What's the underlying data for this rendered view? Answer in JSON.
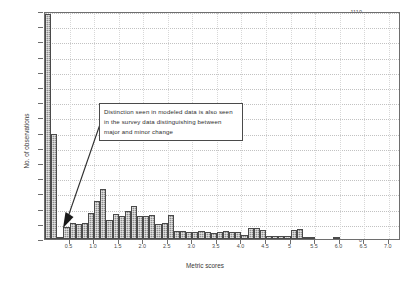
{
  "figure": {
    "background": "#ffffff",
    "frame_color": "#6e6e6e",
    "bar_fill": "#8e8e8e",
    "bar_edge": "#4a4a4a"
  },
  "annotation": {
    "text": "Distinction seen in modeled data is also seen in the survey data distinguishing between major and minor change",
    "pointer": "arrow-to-low-bin"
  },
  "chart_data": {
    "type": "bar",
    "title": "",
    "xlabel": "Metric scores",
    "ylabel": "No. of observations",
    "grid": true,
    "legend": "none",
    "xlim": [
      0.0,
      7.25
    ],
    "ylim": [
      0,
      1110
    ],
    "ytick_step": 74,
    "yticks": [
      0,
      74,
      148,
      222,
      296,
      370,
      444,
      518,
      592,
      666,
      740,
      814,
      888,
      962,
      1036,
      1110
    ],
    "ytick_labels": [
      "0",
      "74",
      "148",
      "222",
      "296",
      "370",
      "444",
      "518",
      "592",
      "666",
      "740",
      "814",
      "888",
      "962",
      "1036",
      "1110"
    ],
    "xticks": [
      0.5,
      1.0,
      1.5,
      2.0,
      2.5,
      3.0,
      3.5,
      4.0,
      4.5,
      5.0,
      5.5,
      6.0,
      6.5,
      7.0
    ],
    "xtick_labels": [
      "0.5",
      "1.0",
      "1.5",
      "2.0",
      "2.5",
      "3.0",
      "3.5",
      "4.0",
      "4.5",
      "5",
      "5.5",
      "6.0",
      "6.5",
      "7.0"
    ],
    "bin_width": 0.125,
    "bin_centers": [
      0.0625,
      0.1875,
      0.3125,
      0.4375,
      0.5625,
      0.6875,
      0.8125,
      0.9375,
      1.0625,
      1.1875,
      1.3125,
      1.4375,
      1.5625,
      1.6875,
      1.8125,
      1.9375,
      2.0625,
      2.1875,
      2.3125,
      2.4375,
      2.5625,
      2.6875,
      2.8125,
      2.9375,
      3.0625,
      3.1875,
      3.3125,
      3.4375,
      3.5625,
      3.6875,
      3.8125,
      3.9375,
      4.0625,
      4.1875,
      4.3125,
      4.4375,
      4.5625,
      4.6875,
      4.8125,
      4.9375,
      5.0625,
      5.1875,
      5.3125,
      5.4375,
      5.5625,
      5.6875,
      5.8125,
      5.9375,
      6.0625,
      6.1875,
      6.3125,
      6.4375,
      6.5625,
      6.6875,
      6.8125,
      6.9375
    ],
    "categories": [
      "0.06",
      "0.19",
      "0.31",
      "0.44",
      "0.56",
      "0.69",
      "0.81",
      "0.94",
      "1.06",
      "1.19",
      "1.31",
      "1.44",
      "1.56",
      "1.69",
      "1.81",
      "1.94",
      "2.06",
      "2.19",
      "2.31",
      "2.44",
      "2.56",
      "2.69",
      "2.81",
      "2.94",
      "3.06",
      "3.19",
      "3.31",
      "3.44",
      "3.56",
      "3.69",
      "3.81",
      "3.94",
      "4.06",
      "4.19",
      "4.31",
      "4.44",
      "4.56",
      "4.69",
      "4.81",
      "4.94",
      "5.06",
      "5.19",
      "5.31",
      "5.44",
      "5.56",
      "5.69",
      "5.81",
      "5.94",
      "6.06",
      "6.19",
      "6.31",
      "6.44",
      "6.56",
      "6.69",
      "6.81",
      "6.94"
    ],
    "values": [
      1095,
      510,
      10,
      60,
      80,
      75,
      80,
      125,
      185,
      245,
      95,
      120,
      110,
      135,
      160,
      110,
      110,
      115,
      75,
      80,
      115,
      40,
      40,
      35,
      35,
      40,
      35,
      30,
      35,
      40,
      35,
      35,
      20,
      55,
      55,
      45,
      15,
      15,
      15,
      15,
      45,
      50,
      10,
      5,
      0,
      0,
      0,
      12,
      0,
      0,
      0,
      0,
      0,
      0,
      0,
      0
    ],
    "series": [
      {
        "name": "observations",
        "values": [
          1095,
          510,
          10,
          60,
          80,
          75,
          80,
          125,
          185,
          245,
          95,
          120,
          110,
          135,
          160,
          110,
          110,
          115,
          75,
          80,
          115,
          40,
          40,
          35,
          35,
          40,
          35,
          30,
          35,
          40,
          35,
          35,
          20,
          55,
          55,
          45,
          15,
          15,
          15,
          15,
          45,
          50,
          10,
          5,
          0,
          0,
          0,
          12,
          0,
          0,
          0,
          0,
          0,
          0,
          0,
          0
        ]
      }
    ],
    "annotations": [
      {
        "text": "Distinction seen in modeled data is also seen in the survey data distinguishing between major and minor change",
        "points_to_x": 0.33,
        "points_to_y": 12
      }
    ]
  }
}
